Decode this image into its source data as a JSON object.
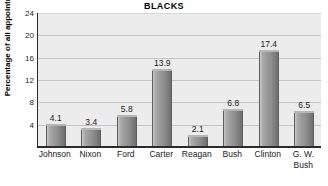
{
  "chart_data": {
    "type": "bar",
    "title": "BLACKS",
    "xlabel": "",
    "ylabel": "Percentage of all appointments",
    "ylim": [
      0,
      24
    ],
    "yticks": [
      24,
      20,
      16,
      12,
      8,
      4
    ],
    "grid": true,
    "legend": "none",
    "categories": [
      "Johnson",
      "Nixon",
      "Ford",
      "Carter",
      "Reagan",
      "Bush",
      "Clinton",
      "G. W. Bush"
    ],
    "category_lines": [
      [
        "Johnson"
      ],
      [
        "Nixon"
      ],
      [
        "Ford"
      ],
      [
        "Carter"
      ],
      [
        "Reagan"
      ],
      [
        "Bush"
      ],
      [
        "Clinton"
      ],
      [
        "G. W.",
        "Bush"
      ]
    ],
    "values": [
      4.1,
      3.4,
      5.8,
      13.9,
      2.1,
      6.8,
      17.4,
      6.5
    ],
    "value_labels": [
      "4.1",
      "3.4",
      "5.8",
      "13.9",
      "2.1",
      "6.8",
      "17.4",
      "6.5"
    ],
    "colors": {
      "plot_background": "#ececec",
      "gridline": "#c4c4c4",
      "axis": "#2b2b2b",
      "bar_light": "#c8c8c8",
      "bar_dark": "#6e6e6e",
      "text": "#1a1a1a"
    }
  }
}
